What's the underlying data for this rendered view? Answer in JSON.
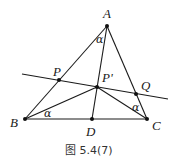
{
  "figure": {
    "caption": "图 5.4(7)",
    "points": {
      "A": {
        "label": "A",
        "x": 107,
        "y": 26
      },
      "B": {
        "label": "B",
        "x": 25,
        "y": 119
      },
      "C": {
        "label": "C",
        "x": 147,
        "y": 119
      },
      "D": {
        "label": "D",
        "x": 92,
        "y": 119
      },
      "P_prime": {
        "label": "P'",
        "x": 97,
        "y": 87
      },
      "P": {
        "label": "P",
        "x": 59,
        "y": 80
      },
      "Q": {
        "label": "Q",
        "x": 136,
        "y": 94
      }
    },
    "angle_labels": {
      "at_A": "α",
      "at_B": "α",
      "at_C": "α"
    },
    "segments": [
      "AB",
      "AC",
      "BC",
      "AD",
      "BP'",
      "CP'",
      "PQ-line"
    ],
    "colors": {
      "stroke": "#1a1a1a",
      "background": "#ffffff"
    }
  }
}
